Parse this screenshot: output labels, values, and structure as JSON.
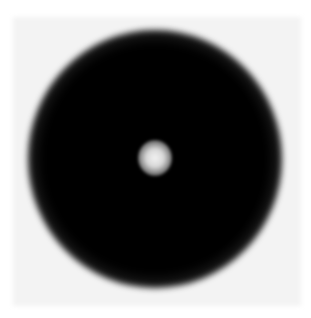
{
  "image": {
    "description": "Grayscale circular dark ring with a bright central spot on a white background",
    "width": 311,
    "height": 318,
    "colors": {
      "background": "#ffffff",
      "plate": "#f3f3f3",
      "ring_dark": "#000000",
      "halo_mid": "#9a9a9a",
      "center_spot": "#f2f2f2"
    },
    "shapes": {
      "dark_disk_center": [
        155,
        158
      ],
      "dark_disk_radius": 95,
      "halo_radius": 127,
      "center_spot_radius": 17
    }
  }
}
